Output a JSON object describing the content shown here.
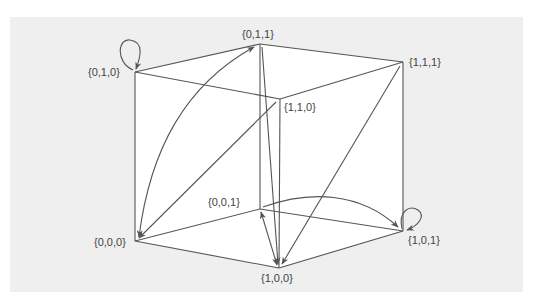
{
  "diagram": {
    "type": "state-transition-cube",
    "colors": {
      "background": "#efefef",
      "face": "#ffffff",
      "line": "#555555",
      "text": "#444444"
    },
    "nodes": [
      {
        "id": "010",
        "label": "{0,1,0}",
        "x": 135,
        "y": 72
      },
      {
        "id": "011",
        "label": "{0,1,1}",
        "x": 260,
        "y": 44
      },
      {
        "id": "111",
        "label": "{1,1,1}",
        "x": 403,
        "y": 62
      },
      {
        "id": "110",
        "label": "{1,1,0}",
        "x": 280,
        "y": 99
      },
      {
        "id": "001",
        "label": "{0,0,1}",
        "x": 260,
        "y": 209
      },
      {
        "id": "000",
        "label": "{0,0,0}",
        "x": 135,
        "y": 241
      },
      {
        "id": "101",
        "label": "{1,0,1}",
        "x": 403,
        "y": 231
      },
      {
        "id": "100",
        "label": "{1,0,0}",
        "x": 279,
        "y": 268
      }
    ],
    "cube_edges": [
      [
        "010",
        "011"
      ],
      [
        "011",
        "111"
      ],
      [
        "111",
        "110"
      ],
      [
        "110",
        "010"
      ],
      [
        "000",
        "001"
      ],
      [
        "001",
        "101"
      ],
      [
        "101",
        "100"
      ],
      [
        "100",
        "000"
      ],
      [
        "010",
        "000"
      ],
      [
        "011",
        "001"
      ],
      [
        "111",
        "101"
      ],
      [
        "110",
        "100"
      ]
    ],
    "transitions": [
      {
        "from": "010",
        "to": "010",
        "kind": "self-loop"
      },
      {
        "from": "101",
        "to": "101",
        "kind": "self-loop"
      },
      {
        "from": "000",
        "to": "011",
        "kind": "arrow",
        "bidirectional": true,
        "curved": true
      },
      {
        "from": "110",
        "to": "000",
        "kind": "arrow"
      },
      {
        "from": "011",
        "to": "100",
        "kind": "arrow"
      },
      {
        "from": "111",
        "to": "100",
        "kind": "arrow"
      },
      {
        "from": "100",
        "to": "001",
        "kind": "arrow",
        "bidirectional": true
      },
      {
        "from": "001",
        "to": "101",
        "kind": "arrow",
        "curved": true
      }
    ]
  }
}
